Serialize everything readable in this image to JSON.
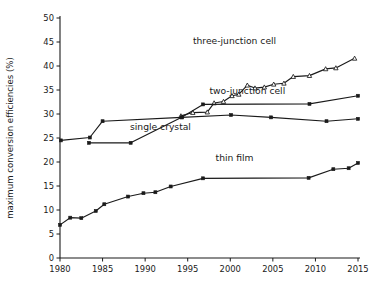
{
  "chart_data": {
    "type": "line",
    "title": "",
    "xlabel": "",
    "ylabel": "maximum conversion efficiencies (%)",
    "xlim": [
      1980,
      2015
    ],
    "ylim": [
      0,
      50
    ],
    "xticks": [
      1980,
      1985,
      1990,
      1995,
      2000,
      2005,
      2010,
      2015
    ],
    "yticks": [
      0,
      5,
      10,
      15,
      20,
      25,
      30,
      35,
      40,
      45,
      50
    ],
    "grid": false,
    "legend": "inline-annotations",
    "series": [
      {
        "name": "three-junction cell",
        "marker": "open-triangle",
        "label_x": 2000.5,
        "label_y": 44.6,
        "points": [
          {
            "x": 1994.2,
            "y": 29.6
          },
          {
            "x": 1995.6,
            "y": 30.3
          },
          {
            "x": 1997.3,
            "y": 30.4
          },
          {
            "x": 1998.1,
            "y": 32.3
          },
          {
            "x": 1999.2,
            "y": 32.6
          },
          {
            "x": 2000.2,
            "y": 33.8
          },
          {
            "x": 2001.0,
            "y": 34.1
          },
          {
            "x": 2002.0,
            "y": 36.0
          },
          {
            "x": 2002.9,
            "y": 35.4
          },
          {
            "x": 2004.0,
            "y": 35.6
          },
          {
            "x": 2005.1,
            "y": 36.2
          },
          {
            "x": 2006.3,
            "y": 36.4
          },
          {
            "x": 2007.4,
            "y": 37.8
          },
          {
            "x": 2009.3,
            "y": 38.0
          },
          {
            "x": 2011.2,
            "y": 39.4
          },
          {
            "x": 2012.4,
            "y": 39.6
          },
          {
            "x": 2014.6,
            "y": 41.6
          }
        ]
      },
      {
        "name": "two-junction cell",
        "marker": "filled-square",
        "label_x": 2002.0,
        "label_y": 34.2,
        "points": [
          {
            "x": 1983.4,
            "y": 24.0
          },
          {
            "x": 1988.3,
            "y": 24.0
          },
          {
            "x": 1994.3,
            "y": 29.3
          },
          {
            "x": 1996.8,
            "y": 32.0
          },
          {
            "x": 2009.3,
            "y": 32.1
          },
          {
            "x": 2015.0,
            "y": 33.8
          }
        ]
      },
      {
        "name": "single crystal",
        "marker": "filled-square",
        "label_x": 1991.8,
        "label_y": 26.6,
        "points": [
          {
            "x": 1980.1,
            "y": 24.5
          },
          {
            "x": 1983.5,
            "y": 25.1
          },
          {
            "x": 1985.0,
            "y": 28.5
          },
          {
            "x": 1994.3,
            "y": 29.3
          },
          {
            "x": 2000.1,
            "y": 29.8
          },
          {
            "x": 2004.8,
            "y": 29.3
          },
          {
            "x": 2011.3,
            "y": 28.5
          },
          {
            "x": 2015.0,
            "y": 29.0
          }
        ]
      },
      {
        "name": "thin film",
        "marker": "filled-square",
        "label_x": 2000.5,
        "label_y": 20.3,
        "points": [
          {
            "x": 1980.0,
            "y": 6.9
          },
          {
            "x": 1981.2,
            "y": 8.4
          },
          {
            "x": 1982.5,
            "y": 8.3
          },
          {
            "x": 1984.2,
            "y": 9.8
          },
          {
            "x": 1985.2,
            "y": 11.2
          },
          {
            "x": 1988.0,
            "y": 12.8
          },
          {
            "x": 1989.8,
            "y": 13.5
          },
          {
            "x": 1991.2,
            "y": 13.7
          },
          {
            "x": 1993.0,
            "y": 14.9
          },
          {
            "x": 1996.8,
            "y": 16.6
          },
          {
            "x": 2009.2,
            "y": 16.7
          },
          {
            "x": 2012.1,
            "y": 18.5
          },
          {
            "x": 2013.9,
            "y": 18.7
          },
          {
            "x": 2015.0,
            "y": 19.8
          }
        ]
      }
    ]
  },
  "colors": {
    "ink": "#1a1a1a",
    "background": "#ffffff"
  }
}
